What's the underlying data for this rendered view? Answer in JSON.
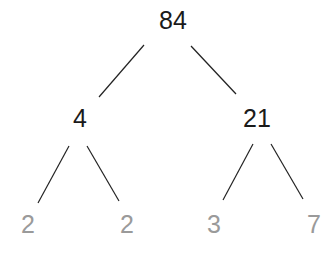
{
  "diagram": {
    "type": "factor-tree",
    "root": {
      "label": "84",
      "x": 173,
      "y": 20
    },
    "level1": [
      {
        "label": "4",
        "x": 80,
        "y": 118
      },
      {
        "label": "21",
        "x": 257,
        "y": 118
      }
    ],
    "leaves": [
      {
        "label": "2",
        "x": 28,
        "y": 224
      },
      {
        "label": "2",
        "x": 127,
        "y": 224
      },
      {
        "label": "3",
        "x": 214,
        "y": 224
      },
      {
        "label": "7",
        "x": 314,
        "y": 224
      }
    ],
    "edges": [
      {
        "from": "84",
        "to": "4",
        "x1": 144,
        "y1": 45,
        "x2": 99,
        "y2": 97
      },
      {
        "from": "84",
        "to": "21",
        "x1": 191,
        "y1": 46,
        "x2": 236,
        "y2": 94
      },
      {
        "from": "4",
        "to": "2",
        "x1": 69,
        "y1": 146,
        "x2": 38,
        "y2": 203
      },
      {
        "from": "4",
        "to": "2",
        "x1": 87,
        "y1": 146,
        "x2": 119,
        "y2": 201
      },
      {
        "from": "21",
        "to": "3",
        "x1": 253,
        "y1": 144,
        "x2": 223,
        "y2": 200
      },
      {
        "from": "21",
        "to": "7",
        "x1": 271,
        "y1": 144,
        "x2": 303,
        "y2": 199
      }
    ],
    "colors": {
      "composite": "#1a1a1a",
      "prime": "#9a9a9a",
      "edge": "#222222"
    }
  }
}
